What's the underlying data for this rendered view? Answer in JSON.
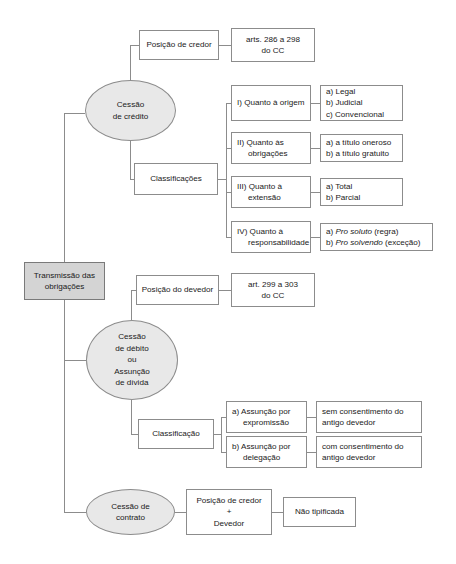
{
  "diagram": {
    "title": "Transmissão das obrigações",
    "root": {
      "label_line1": "Transmissão das",
      "label_line2": "obrigações"
    },
    "branch_credito": {
      "ellipse_line1": "Cessão",
      "ellipse_line2": "de crédito",
      "posicao_line1": "Posição de credor",
      "artigos_line1": "arts. 286 a 298",
      "artigos_line2": "do CC",
      "classificacoes_label": "Classificações",
      "items": [
        {
          "title_line1": "I) Quanto à origem",
          "title_line2": "",
          "details": [
            "a) Legal",
            "b) Judicial",
            "c) Convencional"
          ]
        },
        {
          "title_line1": "II) Quanto às",
          "title_line2": "obrigações",
          "details": [
            "a) a título oneroso",
            "b) a título gratuito"
          ]
        },
        {
          "title_line1": "III) Quanto à",
          "title_line2": "extensão",
          "details": [
            "a) Total",
            "b) Parcial"
          ]
        },
        {
          "title_line1": "IV) Quanto à",
          "title_line2": "responsabilidade",
          "details_rich": [
            {
              "prefix": "a) ",
              "italic": "Pro soluto",
              "suffix": " (regra)"
            },
            {
              "prefix": "b) ",
              "italic": "Pro solvendo",
              "suffix": " (exceção)"
            }
          ]
        }
      ]
    },
    "branch_debito": {
      "ellipse_line1": "Cessão",
      "ellipse_line2": "de débito",
      "ellipse_line3": "ou",
      "ellipse_line4": "Assunção",
      "ellipse_line5": "de dívida",
      "posicao_line1": "Posição do devedor",
      "artigos_line1": "art. 299 a 303",
      "artigos_line2": "do CC",
      "classificacao_label": "Classificação",
      "items": [
        {
          "title_line1": "a) Assunção por",
          "title_line2": "expromissão",
          "detail_line1": "sem consentimento do",
          "detail_line2": "antigo devedor"
        },
        {
          "title_line1": "b) Assunção por",
          "title_line2": "delegação",
          "detail_line1": "com consentimento do",
          "detail_line2": "antigo devedor"
        }
      ]
    },
    "branch_contrato": {
      "ellipse_line1": "Cessão de",
      "ellipse_line2": "contrato",
      "posicao_line1": "Posição de credor",
      "posicao_line2": "+",
      "posicao_line3": "Devedor",
      "resultado_line1": "Não tipificada"
    },
    "colors": {
      "root_fill": "#d4d4d4",
      "ellipse_fill": "#e8e8e8",
      "box_fill": "#ffffff",
      "stroke": "#8c8c8c",
      "text": "#1a1a1a"
    }
  }
}
